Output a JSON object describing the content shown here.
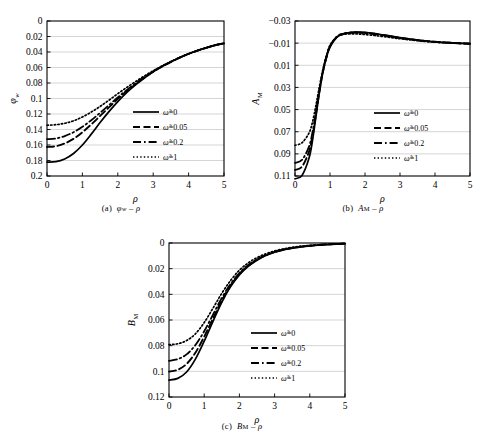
{
  "figure": {
    "panels": [
      {
        "id": "a",
        "caption": "(a)  φw − ρ",
        "caption_symbol": "φ",
        "caption_sub": "w"
      },
      {
        "id": "b",
        "caption": "(b)  AM − ρ",
        "caption_symbol": "A",
        "caption_sub": "M"
      },
      {
        "id": "c",
        "caption": "(c)  BM − ρ",
        "caption_symbol": "B",
        "caption_sub": "M"
      }
    ]
  },
  "legend": {
    "entries": [
      {
        "label": "ω̃=0",
        "style": "solid",
        "symbol": "ω",
        "value": "0"
      },
      {
        "label": "ω̃=0.05",
        "style": "dashed",
        "symbol": "ω",
        "value": "0.05"
      },
      {
        "label": "ω̃=0.2",
        "style": "dashdot",
        "symbol": "ω",
        "value": "0.2"
      },
      {
        "label": "ω̃=1",
        "style": "dotted",
        "symbol": "ω",
        "value": "1"
      }
    ]
  },
  "chart_data": [
    {
      "type": "line",
      "id": "a",
      "title": "(a) φw − ρ",
      "xlabel": "ρ",
      "ylabel": "φw",
      "xlim": [
        0,
        5
      ],
      "ylim": [
        0,
        0.2
      ],
      "y_inverted": true,
      "xticks": [
        "0",
        "1",
        "2",
        "3",
        "4",
        "5"
      ],
      "yticks": [
        "0",
        "0.02",
        "0.04",
        "0.06",
        "0.08",
        "0.1",
        "0.12",
        "0.14",
        "0.16",
        "0.18",
        "0.2"
      ],
      "grid": "horizontal",
      "legend_position": "lower-right",
      "x": [
        0,
        0.25,
        0.5,
        0.75,
        1.0,
        1.25,
        1.5,
        1.75,
        2.0,
        2.25,
        2.5,
        2.75,
        3.0,
        3.25,
        3.5,
        3.75,
        4.0,
        4.25,
        4.5,
        4.75,
        5.0
      ],
      "series": [
        {
          "name": "ω̃=0",
          "style": "solid",
          "values": [
            0.182,
            0.1815,
            0.178,
            0.171,
            0.16,
            0.146,
            0.131,
            0.117,
            0.104,
            0.0925,
            0.0825,
            0.0735,
            0.0655,
            0.0585,
            0.0525,
            0.047,
            0.0422,
            0.038,
            0.0345,
            0.0312,
            0.0288
          ]
        },
        {
          "name": "ω̃=0.05",
          "style": "dashed",
          "values": [
            0.1625,
            0.1615,
            0.158,
            0.152,
            0.1435,
            0.1335,
            0.1225,
            0.1115,
            0.1005,
            0.0905,
            0.0815,
            0.0732,
            0.0655,
            0.0588,
            0.0528,
            0.0473,
            0.0425,
            0.0382,
            0.0346,
            0.0313,
            0.0288
          ]
        },
        {
          "name": "ω̃=0.2",
          "style": "dashdot",
          "values": [
            0.1525,
            0.1515,
            0.1485,
            0.1435,
            0.1365,
            0.128,
            0.1185,
            0.1085,
            0.0985,
            0.0892,
            0.0805,
            0.0725,
            0.0652,
            0.0586,
            0.0527,
            0.0472,
            0.0424,
            0.0382,
            0.0346,
            0.0313,
            0.0288
          ]
        },
        {
          "name": "ω̃=1",
          "style": "dotted",
          "values": [
            0.1345,
            0.1338,
            0.132,
            0.1288,
            0.1238,
            0.1175,
            0.1102,
            0.1022,
            0.0938,
            0.0858,
            0.0782,
            0.071,
            0.0642,
            0.058,
            0.0524,
            0.047,
            0.0423,
            0.0381,
            0.0345,
            0.0312,
            0.0288
          ]
        }
      ]
    },
    {
      "type": "line",
      "id": "b",
      "title": "(b) AM − ρ",
      "xlabel": "ρ",
      "ylabel": "AM",
      "xlim": [
        0,
        5
      ],
      "ylim": [
        -0.03,
        0.11
      ],
      "y_inverted": true,
      "xticks": [
        "0",
        "1",
        "2",
        "3",
        "4",
        "5"
      ],
      "yticks": [
        "−0.03",
        "−0.01",
        "0.01",
        "0.03",
        "0.05",
        "0.07",
        "0.09",
        "0.11"
      ],
      "grid": "horizontal",
      "legend_position": "lower-right",
      "x": [
        0,
        0.2,
        0.4,
        0.5,
        0.6,
        0.7,
        0.8,
        0.9,
        1.0,
        1.2,
        1.4,
        1.6,
        1.8,
        2.0,
        2.25,
        2.5,
        2.75,
        3.0,
        3.5,
        4.0,
        4.5,
        5.0
      ],
      "series": [
        {
          "name": "ω̃=0",
          "style": "solid",
          "values": [
            0.1125,
            0.1095,
            0.094,
            0.078,
            0.056,
            0.034,
            0.016,
            0.003,
            -0.0065,
            -0.0155,
            -0.0185,
            -0.0196,
            -0.02,
            -0.0197,
            -0.0188,
            -0.0176,
            -0.0163,
            -0.015,
            -0.0128,
            -0.0112,
            -0.0102,
            -0.0095
          ]
        },
        {
          "name": "ω̃=0.05",
          "style": "dashed",
          "values": [
            0.1045,
            0.1015,
            0.088,
            0.074,
            0.054,
            0.033,
            0.0155,
            0.0025,
            -0.007,
            -0.0158,
            -0.0186,
            -0.0196,
            -0.0198,
            -0.0194,
            -0.0185,
            -0.0173,
            -0.016,
            -0.0148,
            -0.0127,
            -0.0112,
            -0.0102,
            -0.0095
          ]
        },
        {
          "name": "ω̃=0.2",
          "style": "dashdot",
          "values": [
            0.0982,
            0.0955,
            0.0835,
            0.0705,
            0.0518,
            0.0318,
            0.0148,
            0.002,
            -0.0074,
            -0.016,
            -0.0187,
            -0.0195,
            -0.0196,
            -0.0191,
            -0.0182,
            -0.017,
            -0.0158,
            -0.0146,
            -0.0126,
            -0.0111,
            -0.0102,
            -0.0095
          ]
        },
        {
          "name": "ω̃=1",
          "style": "dotted",
          "values": [
            0.0822,
            0.08,
            0.0712,
            0.0612,
            0.0458,
            0.0288,
            0.0132,
            0.001,
            -0.008,
            -0.0158,
            -0.018,
            -0.0184,
            -0.0183,
            -0.0178,
            -0.017,
            -0.016,
            -0.015,
            -0.014,
            -0.0122,
            -0.0109,
            -0.0101,
            -0.0095
          ]
        }
      ]
    },
    {
      "type": "line",
      "id": "c",
      "title": "(c) BM − ρ",
      "xlabel": "ρ",
      "ylabel": "BM",
      "xlim": [
        0,
        5
      ],
      "ylim": [
        0,
        0.12
      ],
      "y_inverted": true,
      "xticks": [
        "0",
        "1",
        "2",
        "3",
        "4",
        "5"
      ],
      "yticks": [
        "0",
        "0.02",
        "0.04",
        "0.06",
        "0.08",
        "0.1",
        "0.12"
      ],
      "grid": "horizontal",
      "legend_position": "lower-right",
      "x": [
        0,
        0.25,
        0.5,
        0.75,
        1.0,
        1.25,
        1.5,
        1.75,
        2.0,
        2.25,
        2.5,
        2.75,
        3.0,
        3.25,
        3.5,
        3.75,
        4.0,
        4.25,
        4.5,
        4.75,
        5.0
      ],
      "series": [
        {
          "name": "ω̃=0",
          "style": "solid",
          "values": [
            0.1068,
            0.1055,
            0.1005,
            0.0905,
            0.0765,
            0.061,
            0.0462,
            0.034,
            0.0248,
            0.0182,
            0.0134,
            0.0098,
            0.0072,
            0.0054,
            0.004,
            0.003,
            0.0022,
            0.0016,
            0.0012,
            0.0008,
            0.0005
          ]
        },
        {
          "name": "ω̃=0.05",
          "style": "dashed",
          "values": [
            0.1002,
            0.0988,
            0.0942,
            0.0855,
            0.073,
            0.0588,
            0.0448,
            0.0332,
            0.0242,
            0.0178,
            0.0131,
            0.0096,
            0.0071,
            0.0053,
            0.0039,
            0.0029,
            0.0022,
            0.0016,
            0.0011,
            0.0008,
            0.0005
          ]
        },
        {
          "name": "ω̃=0.2",
          "style": "dashdot",
          "values": [
            0.0918,
            0.0905,
            0.0868,
            0.0795,
            0.0688,
            0.0558,
            0.0428,
            0.032,
            0.0234,
            0.0172,
            0.0127,
            0.0094,
            0.0069,
            0.0051,
            0.0038,
            0.0028,
            0.0021,
            0.0015,
            0.0011,
            0.0008,
            0.0005
          ]
        },
        {
          "name": "ω̃=1",
          "style": "dotted",
          "values": [
            0.0792,
            0.0785,
            0.076,
            0.0708,
            0.062,
            0.0508,
            0.0392,
            0.0292,
            0.0212,
            0.0155,
            0.0114,
            0.0084,
            0.0062,
            0.0046,
            0.0034,
            0.0025,
            0.0019,
            0.0014,
            0.001,
            0.0007,
            0.0005
          ]
        }
      ]
    }
  ]
}
